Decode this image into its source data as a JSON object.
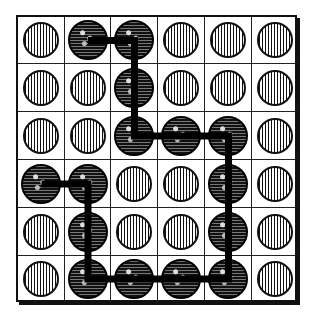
{
  "board": {
    "rows": 6,
    "cols": 6,
    "cells": [
      [
        "empty",
        "filled",
        "filled",
        "empty",
        "empty",
        "empty"
      ],
      [
        "empty",
        "empty",
        "filled",
        "empty",
        "empty",
        "empty"
      ],
      [
        "empty",
        "empty",
        "filled",
        "filled",
        "filled",
        "empty"
      ],
      [
        "filled",
        "filled",
        "empty",
        "empty",
        "filled",
        "empty"
      ],
      [
        "empty",
        "filled",
        "empty",
        "empty",
        "filled",
        "empty"
      ],
      [
        "empty",
        "filled",
        "filled",
        "filled",
        "filled",
        "empty"
      ]
    ],
    "path": [
      [
        0,
        1
      ],
      [
        0,
        2
      ],
      [
        1,
        2
      ],
      [
        2,
        2
      ],
      [
        2,
        3
      ],
      [
        2,
        4
      ],
      [
        3,
        4
      ],
      [
        4,
        4
      ],
      [
        5,
        4
      ],
      [
        5,
        3
      ],
      [
        5,
        2
      ],
      [
        5,
        1
      ],
      [
        4,
        1
      ],
      [
        3,
        1
      ],
      [
        3,
        0
      ]
    ],
    "colors": {
      "grid": "#222222",
      "path": "#000000",
      "background": "#ffffff"
    }
  }
}
